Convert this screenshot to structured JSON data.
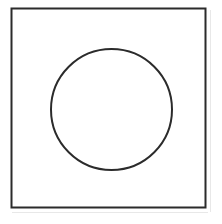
{
  "figure": {
    "background_color": "#ffffff",
    "canvas": {
      "width": 222,
      "height": 224
    },
    "stroke_color": "#2b2b2b",
    "scan_artifact_color": "#e8e8e8",
    "shapes": [
      {
        "name": "square",
        "type": "rect",
        "x": 11.5,
        "y": 8.5,
        "width": 194,
        "height": 199,
        "stroke_width": 2,
        "fill": "none"
      },
      {
        "name": "circle",
        "type": "circle",
        "cx": 111.5,
        "cy": 109.5,
        "r": 60.5,
        "stroke_width": 2,
        "fill": "none"
      }
    ],
    "artifacts": [
      {
        "name": "bottom-scan-shadow",
        "type": "line",
        "x1": 12,
        "y1": 212.5,
        "x2": 208,
        "y2": 212.5,
        "stroke_width": 1
      },
      {
        "name": "right-scan-shadow",
        "type": "line",
        "x1": 210.5,
        "y1": 10,
        "x2": 210.5,
        "y2": 212,
        "stroke_width": 1
      }
    ]
  }
}
